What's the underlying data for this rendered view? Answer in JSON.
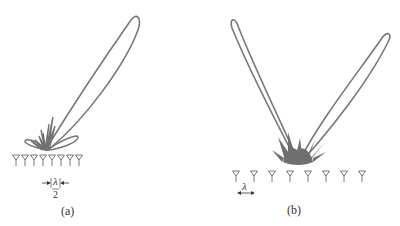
{
  "figure": {
    "panels": [
      {
        "id": "a",
        "caption": "(a)",
        "description": "Linear antenna array with half-wavelength spacing producing a single steered main beam",
        "antenna_count": 8,
        "spacing_label_numerator": "λ",
        "spacing_label_denominator": "2",
        "lobe_color": "#777777"
      },
      {
        "id": "b",
        "caption": "(b)",
        "description": "Linear antenna array with full-wavelength spacing producing a main beam and a grating lobe",
        "antenna_count": 8,
        "spacing_label": "λ",
        "lobe_color": "#777777"
      }
    ]
  }
}
